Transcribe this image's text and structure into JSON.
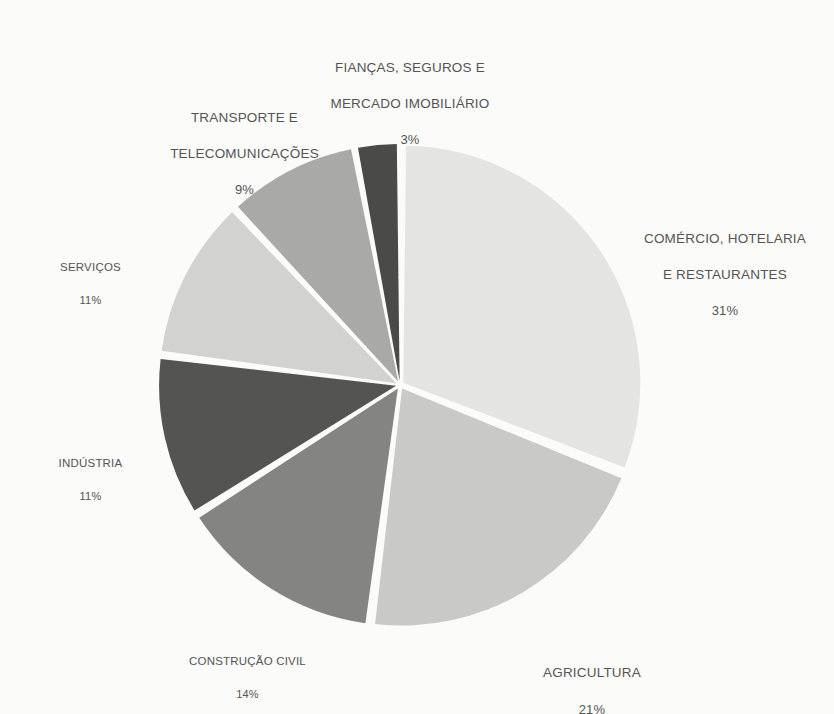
{
  "chart_data": {
    "type": "pie",
    "title": "",
    "subtitle": "",
    "xlabel": "",
    "ylabel": "",
    "legend_position": "none",
    "grid": false,
    "units": "percent",
    "total": 100,
    "start_angle_deg": 0,
    "direction": "clockwise",
    "exploded": true,
    "background_color": "#fbfbfa",
    "label_color": "#555453",
    "categories": [
      "COMÉRCIO, HOTELARIA E RESTAURANTES",
      "AGRICULTURA",
      "CONSTRUÇÃO CIVIL",
      "INDÚSTRIA",
      "SERVIÇOS",
      "TRANSPORTE E TELECOMUNICAÇÕES",
      "FIANÇAS, SEGUROS E MERCADO IMOBILIÁRIO"
    ],
    "values": [
      31,
      21,
      14,
      11,
      11,
      9,
      3
    ],
    "colors": [
      "#e4e4e3",
      "#c9c9c8",
      "#848483",
      "#545453",
      "#d2d2d1",
      "#a9a9a8",
      "#4a4a49"
    ],
    "slices": [
      {
        "id": "comercio",
        "label": "COMÉRCIO, HOTELARIA\nE RESTAURANTES",
        "label_line1": "COMÉRCIO, HOTELARIA",
        "label_line2": "E RESTAURANTES",
        "value": 31,
        "percent_text": "31%",
        "color": "#e4e4e3"
      },
      {
        "id": "agricultura",
        "label": "AGRICULTURA",
        "value": 21,
        "percent_text": "21%",
        "color": "#c9c9c8"
      },
      {
        "id": "construcao-civil",
        "label": "CONSTRUÇÃO CIVIL",
        "value": 14,
        "percent_text": "14%",
        "color": "#848483"
      },
      {
        "id": "industria",
        "label": "INDÚSTRIA",
        "value": 11,
        "percent_text": "11%",
        "color": "#545453"
      },
      {
        "id": "servicos",
        "label": "SERVIÇOS",
        "value": 11,
        "percent_text": "11%",
        "color": "#d2d2d1"
      },
      {
        "id": "transporte",
        "label": "TRANSPORTE E\nTELECOMUNICAÇÕES",
        "label_line1": "TRANSPORTE E",
        "label_line2": "TELECOMUNICAÇÕES",
        "value": 9,
        "percent_text": "9%",
        "color": "#a9a9a8"
      },
      {
        "id": "fiancas",
        "label": "FIANÇAS, SEGUROS E\nMERCADO IMOBILIÁRIO",
        "label_line1": "FIANÇAS, SEGUROS E",
        "label_line2": "MERCADO IMOBILIÁRIO",
        "value": 3,
        "percent_text": "3%",
        "color": "#4a4a49"
      }
    ]
  }
}
